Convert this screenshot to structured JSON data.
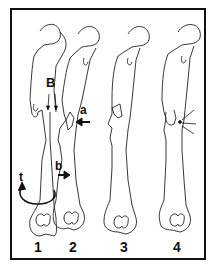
{
  "figure": {
    "panels": [
      {
        "number": "1",
        "description": "femur with mechanism: bending forces a and b, torsion t, fragment B"
      },
      {
        "number": "2",
        "description": "femur (second view of mechanism)"
      },
      {
        "number": "3",
        "description": "femur with butterfly fracture fragment"
      },
      {
        "number": "4",
        "description": "femur with fracture and arrows indicating site"
      }
    ],
    "labels": {
      "B": "B",
      "a": "a",
      "b": "b",
      "t": "t"
    },
    "colors": {
      "line": "#111111",
      "background": "#ffffff"
    }
  }
}
